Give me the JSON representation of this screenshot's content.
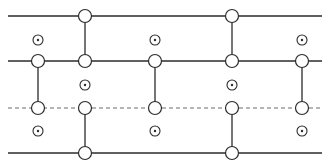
{
  "diagram": {
    "width": 330,
    "height": 168,
    "colors": {
      "stroke": "#2b2b2b",
      "dashed": "#6a6a6a",
      "background": "#ffffff"
    },
    "x_extent": [
      8,
      322
    ],
    "horizontal_lines": [
      {
        "id": "line-1",
        "y": 16,
        "style": "solid"
      },
      {
        "id": "line-2",
        "y": 61,
        "style": "solid"
      },
      {
        "id": "line-3",
        "y": 108,
        "style": "dashed"
      },
      {
        "id": "line-4",
        "y": 153,
        "style": "solid"
      }
    ],
    "open_circles": [
      {
        "x": 85,
        "y": 16
      },
      {
        "x": 232,
        "y": 16
      },
      {
        "x": 38,
        "y": 61
      },
      {
        "x": 85,
        "y": 61
      },
      {
        "x": 155,
        "y": 61
      },
      {
        "x": 232,
        "y": 61
      },
      {
        "x": 302,
        "y": 61
      },
      {
        "x": 38,
        "y": 108
      },
      {
        "x": 85,
        "y": 108
      },
      {
        "x": 155,
        "y": 108
      },
      {
        "x": 232,
        "y": 108
      },
      {
        "x": 302,
        "y": 108
      },
      {
        "x": 85,
        "y": 153
      },
      {
        "x": 232,
        "y": 153
      }
    ],
    "vertical_links": [
      {
        "x": 85,
        "y1": 16,
        "y2": 61
      },
      {
        "x": 232,
        "y1": 16,
        "y2": 61
      },
      {
        "x": 38,
        "y1": 61,
        "y2": 108
      },
      {
        "x": 155,
        "y1": 61,
        "y2": 108
      },
      {
        "x": 302,
        "y1": 61,
        "y2": 108
      },
      {
        "x": 85,
        "y1": 108,
        "y2": 153
      },
      {
        "x": 232,
        "y1": 108,
        "y2": 153
      }
    ],
    "dotted_circles": [
      {
        "x": 38,
        "y": 40
      },
      {
        "x": 155,
        "y": 40
      },
      {
        "x": 302,
        "y": 40
      },
      {
        "x": 85,
        "y": 85
      },
      {
        "x": 232,
        "y": 85
      },
      {
        "x": 38,
        "y": 131
      },
      {
        "x": 155,
        "y": 131
      },
      {
        "x": 302,
        "y": 131
      }
    ],
    "open_circle_radius": 6.5,
    "dotted_circle_radius": 5,
    "dot_radius": 1.2
  }
}
